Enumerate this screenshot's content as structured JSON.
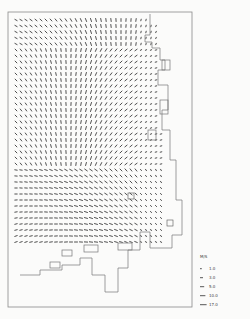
{
  "chart_data": {
    "type": "vector_field",
    "title": "",
    "xlabel": "",
    "ylabel": "",
    "grid": {
      "cols": 30,
      "rows": 38,
      "x0": 16,
      "y0": 20,
      "dx": 5.0,
      "dy": 6.0
    },
    "frame": {
      "x": 8,
      "y": 12,
      "w": 184,
      "h": 295
    },
    "legend": {
      "title": "M/S",
      "entries": [
        {
          "label": "1.0",
          "length": 3
        },
        {
          "label": "3.0",
          "length": 5
        },
        {
          "label": "5.0",
          "length": 7
        },
        {
          "label": "10.0",
          "length": 9
        },
        {
          "label": "17.0",
          "length": 11
        }
      ]
    },
    "markers": [
      {
        "label": "1",
        "x": 131,
        "y": 196
      },
      {
        "label": "1",
        "x": 170,
        "y": 223
      }
    ]
  },
  "colors": {
    "ink": "#3a3a3a",
    "paper": "#fbfbfa",
    "frame": "#8a8a8a"
  }
}
